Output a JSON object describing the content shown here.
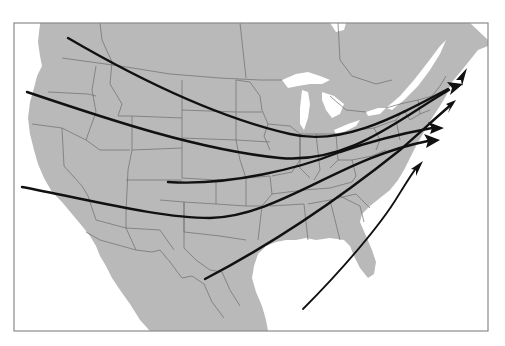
{
  "map": {
    "region": "North America (United States, southern Canada, northern Mexico)",
    "style": "grayscale base map with state/province borders",
    "colors": {
      "land": "#b9b9b9",
      "water": "#ffffff",
      "borders": "#6d6d6d",
      "routes": "#111111",
      "frame": "#8a8a8a"
    },
    "frame": {
      "x": 14,
      "y": 23,
      "width": 474,
      "height": 308
    },
    "routes": [
      {
        "id": 1,
        "name": "route-pacific-northwest",
        "start": [
          68,
          38
        ],
        "end": [
          462,
          84
        ],
        "description": "From Washington across Montana/Dakotas, Great Lakes to Maritimes"
      },
      {
        "id": 2,
        "name": "route-northern-california",
        "start": [
          27,
          92
        ],
        "end": [
          463,
          86
        ],
        "description": "From Oregon/N. California across central plains to Maritimes"
      },
      {
        "id": 3,
        "name": "route-central-plains",
        "start": [
          168,
          182
        ],
        "end": [
          444,
          128
        ],
        "description": "From Colorado/Kansas across Ohio Valley to New England"
      },
      {
        "id": 4,
        "name": "route-southern-california",
        "start": [
          22,
          187
        ],
        "end": [
          438,
          141
        ],
        "description": "From Southern California across Southwest/Oklahoma to Mid-Atlantic"
      },
      {
        "id": 5,
        "name": "route-gulf-texas",
        "start": [
          205,
          279
        ],
        "end": [
          456,
          100
        ],
        "description": "From Texas across the Southeast to the Northeast coast"
      },
      {
        "id": 6,
        "name": "route-gulf-atlantic",
        "start": [
          303,
          309
        ],
        "end": [
          420,
          165
        ],
        "description": "From Gulf of Mexico northeast along Atlantic coast"
      }
    ],
    "arrowheads_count": 6
  }
}
